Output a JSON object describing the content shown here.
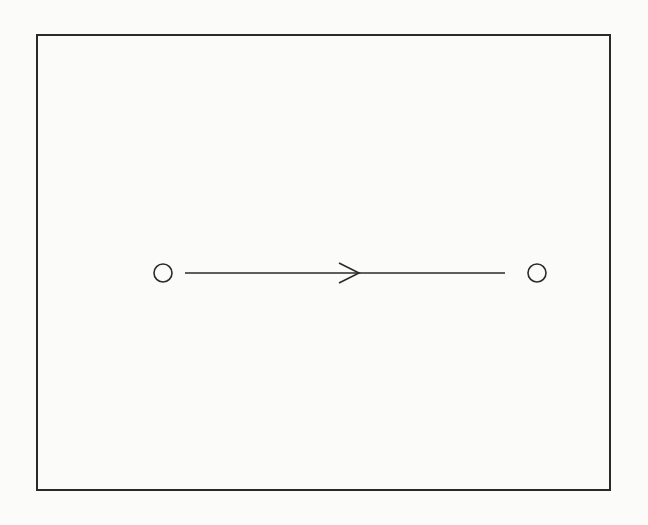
{
  "diagram": {
    "type": "state-transition",
    "frame": {
      "x": 37,
      "y": 35,
      "width": 573,
      "height": 455,
      "stroke": "#2a2a2a"
    },
    "nodes": [
      {
        "id": "start",
        "shape": "circle",
        "cx": 163,
        "cy": 273,
        "r": 9,
        "label": ""
      },
      {
        "id": "end",
        "shape": "circle",
        "cx": 537,
        "cy": 273,
        "r": 9,
        "label": ""
      }
    ],
    "edges": [
      {
        "from": "start",
        "to": "end",
        "x1": 185,
        "y1": 273,
        "x2": 505,
        "y2": 273,
        "direction": "right",
        "arrowhead": {
          "tip_x": 359,
          "tip_y": 273,
          "back_x": 339,
          "half_height": 10
        },
        "label": ""
      }
    ],
    "colors": {
      "background": "#fbfbfa",
      "stroke": "#2a2a2a"
    }
  }
}
